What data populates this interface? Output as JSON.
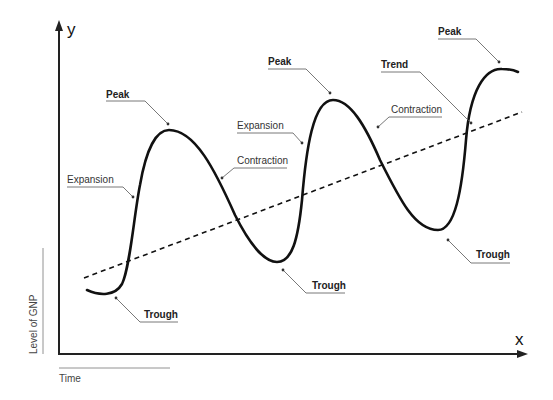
{
  "diagram": {
    "type": "business-cycle",
    "axes": {
      "y_letter": "y",
      "x_letter": "x",
      "y_title": "Level of GNP",
      "x_title": "Time"
    },
    "labels": {
      "peak_1": "Peak",
      "peak_2": "Peak",
      "peak_3": "Peak",
      "trough_1": "Trough",
      "trough_2": "Trough",
      "trough_3": "Trough",
      "expansion_1": "Expansion",
      "expansion_2": "Expansion",
      "contraction_1": "Contraction",
      "contraction_2": "Contraction",
      "trend": "Trend"
    },
    "colors": {
      "curve": "#111111",
      "axis": "#222222",
      "leader": "#555555"
    }
  }
}
